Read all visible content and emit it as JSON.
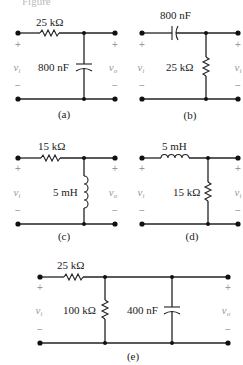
{
  "header_fragment": "Figure",
  "circuits": [
    {
      "id": "a",
      "caption": "(a)",
      "series": {
        "type": "resistor",
        "label": "25 kΩ"
      },
      "shunt": [
        {
          "type": "capacitor",
          "label": "800 nF"
        }
      ],
      "input": "v_i",
      "output": "v_o"
    },
    {
      "id": "b",
      "caption": "(b)",
      "series": {
        "type": "capacitor",
        "label": "800 nF"
      },
      "shunt": [
        {
          "type": "resistor",
          "label": "25 kΩ"
        }
      ],
      "input": "v_i",
      "output": "v_i"
    },
    {
      "id": "c",
      "caption": "(c)",
      "series": {
        "type": "resistor",
        "label": "15 kΩ"
      },
      "shunt": [
        {
          "type": "inductor",
          "label": "5 mH"
        }
      ],
      "input": "v_i",
      "output": "v_o"
    },
    {
      "id": "d",
      "caption": "(d)",
      "series": {
        "type": "inductor",
        "label": "5 mH"
      },
      "shunt": [
        {
          "type": "resistor",
          "label": "15 kΩ"
        }
      ],
      "input": "v_i",
      "output": "v_i"
    },
    {
      "id": "e",
      "caption": "(e)",
      "series": {
        "type": "resistor",
        "label": "25 kΩ"
      },
      "shunt": [
        {
          "type": "resistor",
          "label": "100 kΩ"
        },
        {
          "type": "capacitor",
          "label": "400 nF"
        }
      ],
      "input": "v_i",
      "output": "v_o"
    }
  ],
  "labels": {
    "a_series": "25 kΩ",
    "a_shunt": "800 nF",
    "a_in": "v",
    "a_in_sub": "i",
    "a_out": "v",
    "a_out_sub": "o",
    "a_cap": "(a)",
    "b_series": "800 nF",
    "b_shunt": "25 kΩ",
    "b_in": "v",
    "b_in_sub": "i",
    "b_out": "v",
    "b_out_sub": "i",
    "b_cap": "(b)",
    "c_series": "15 kΩ",
    "c_shunt": "5 mH",
    "c_in": "v",
    "c_in_sub": "i",
    "c_out": "v",
    "c_out_sub": "o",
    "c_cap": "(c)",
    "d_series": "5 mH",
    "d_shunt": "15 kΩ",
    "d_in": "v",
    "d_in_sub": "i",
    "d_out": "v",
    "d_out_sub": "i",
    "d_cap": "(d)",
    "e_series": "25 kΩ",
    "e_shunt1": "100 kΩ",
    "e_shunt2": "400 nF",
    "e_in": "v",
    "e_in_sub": "i",
    "e_out": "v",
    "e_out_sub": "o",
    "e_cap": "(e)",
    "plus": "+",
    "minus": "−"
  }
}
